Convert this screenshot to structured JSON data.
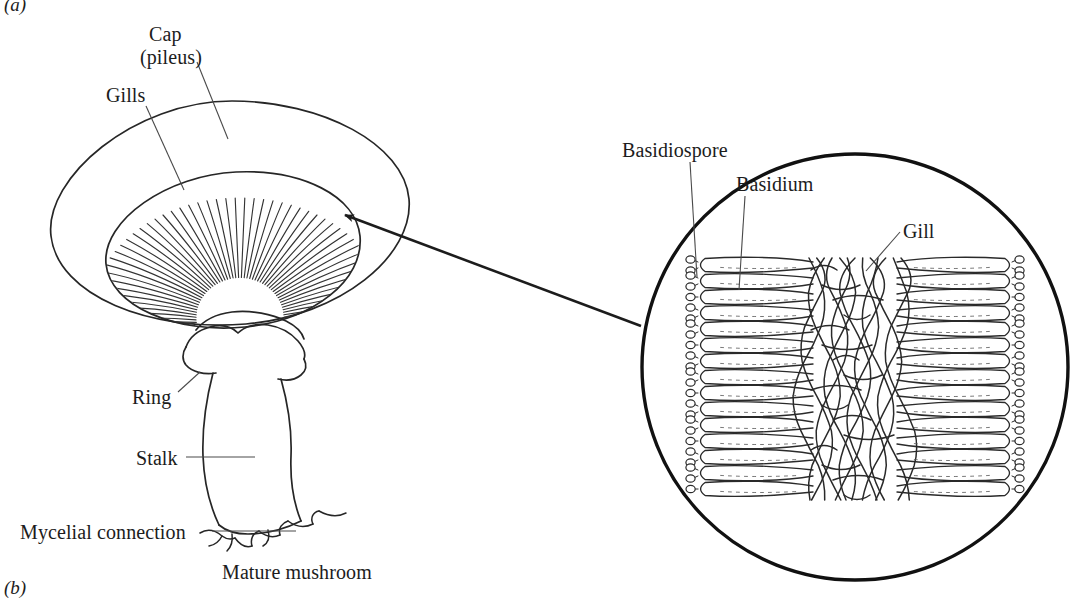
{
  "figure": {
    "panels": [
      {
        "tag": "(a)",
        "name": "panel-a-tag"
      },
      {
        "tag": "(b)",
        "name": "panel-b-tag"
      }
    ]
  },
  "left_panel": {
    "caption": "Mature mushroom",
    "labels": {
      "cap_line1": "Cap",
      "cap_line2": "(pileus)",
      "gills": "Gills",
      "ring": "Ring",
      "stalk": "Stalk",
      "mycelial_connection": "Mycelial connection"
    }
  },
  "right_panel": {
    "labels": {
      "basidiospore": "Basidiospore",
      "basidium": "Basidium",
      "gill": "Gill"
    }
  },
  "style": {
    "ink": "#1c1c1c",
    "line": "#2b2b2b",
    "background": "#ffffff",
    "hatch": "#2f2f2f"
  }
}
